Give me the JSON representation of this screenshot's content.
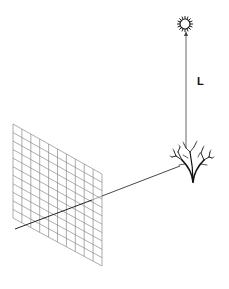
{
  "diagram": {
    "labels": {
      "distance": "L"
    },
    "grid": {
      "columns": 10,
      "rows": 11,
      "corners": {
        "top_left": [
          13,
          124
        ],
        "top_right": [
          102,
          174
        ],
        "bottom_right": [
          102,
          266
        ],
        "bottom_left": [
          13,
          218
        ]
      },
      "color": "#8a8a8a"
    },
    "projection_line": {
      "from": [
        15,
        229
      ],
      "to": [
        180,
        166
      ],
      "color": "#333333"
    },
    "vertical_line": {
      "from": [
        186,
        34
      ],
      "to": [
        186,
        148
      ],
      "color": "#444444"
    },
    "soma": {
      "center": [
        185,
        24
      ],
      "radius": 5,
      "color": "#222222"
    },
    "dendritic_tree": {
      "base": [
        193,
        182
      ],
      "color": "#111111"
    },
    "colors": {
      "background": "#ffffff",
      "ink": "#111111"
    }
  }
}
